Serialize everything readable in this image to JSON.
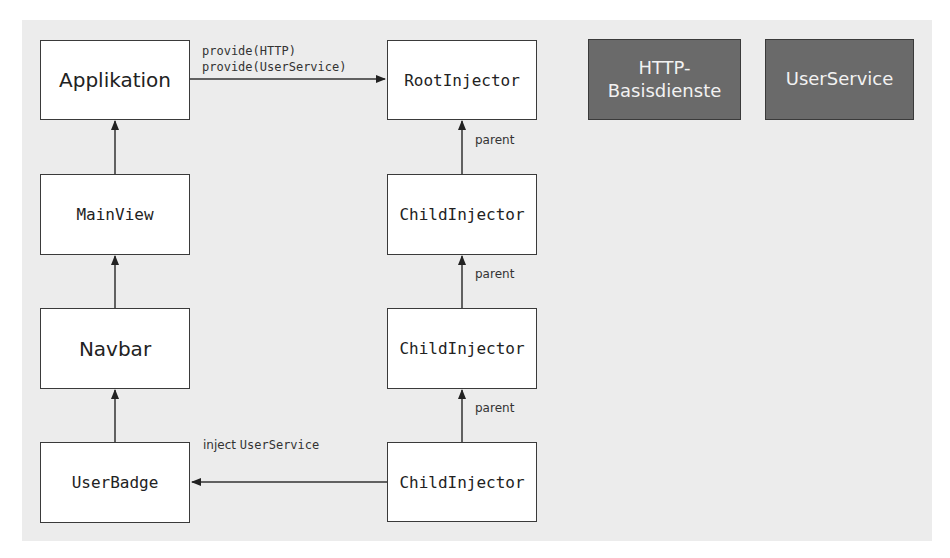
{
  "diagram": {
    "left_column": {
      "applikation": "Applikation",
      "mainview": "MainView",
      "navbar": "Navbar",
      "userbadge": "UserBadge"
    },
    "right_column": {
      "root_injector": "RootInjector",
      "child_injector_1": "ChildInjector",
      "child_injector_2": "ChildInjector",
      "child_injector_3": "ChildInjector"
    },
    "services": {
      "http": "HTTP-\nBasisdienste",
      "userservice": "UserService"
    },
    "edge_labels": {
      "provide_http": "provide(HTTP)",
      "provide_userservice": "provide(UserService)",
      "parent_1": "parent",
      "parent_2": "parent",
      "parent_3": "parent",
      "inject_word": "inject",
      "inject_service": "UserService"
    },
    "colors": {
      "background": "#ececec",
      "box_border": "#3a3a3a",
      "service_fill": "#6a6a6a",
      "service_text": "#f2f2f2"
    }
  }
}
